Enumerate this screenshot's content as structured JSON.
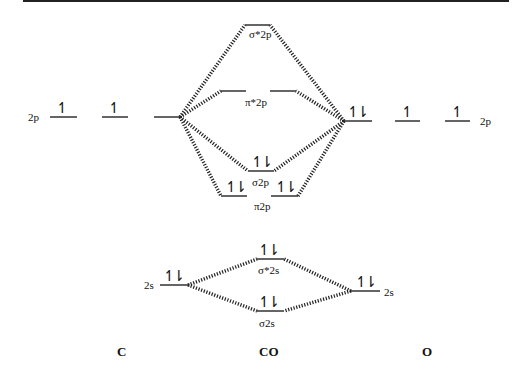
{
  "diagram": {
    "type": "molecular orbital energy diagram",
    "atoms": {
      "left": "C",
      "center": "CO",
      "right": "O"
    },
    "left_levels": {
      "2p_label": "2p",
      "2s_label": "2s"
    },
    "right_levels": {
      "2p_label": "2p",
      "2s_label": "2s"
    },
    "mo_labels": {
      "sigma_star_2p": "σ*2p",
      "pi_star_2p": "π*2p",
      "sigma_2p": "σ2p",
      "pi_2p": "π2p",
      "sigma_star_2s": "σ*2s",
      "sigma_2s": "σ2s"
    },
    "electrons": {
      "single_up": "↿",
      "paired": "↿⇂",
      "C_2p": [
        "↿",
        "↿",
        ""
      ],
      "O_2p": [
        "↿⇂",
        "↿",
        "↿"
      ],
      "C_2s": "↿⇂",
      "O_2s": "↿⇂",
      "sigma_2p": "↿⇂",
      "pi_2p": [
        "↿⇂",
        "↿⇂"
      ],
      "sigma_star_2s": "↿⇂",
      "sigma_2s": "↿⇂",
      "sigma_star_2p": "",
      "pi_star_2p": ""
    },
    "colors": {
      "line": "#111111",
      "frame": "#222222"
    }
  }
}
